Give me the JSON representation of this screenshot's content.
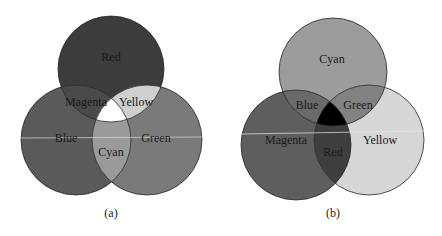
{
  "panels": [
    {
      "caption": "(a)",
      "model": "additive",
      "colors": {
        "primary": "#3c3c3c",
        "left": "#5a5a5a",
        "right": "#7a7a7a",
        "pair_top_left": "#4a4a4a",
        "pair_top_right": "#cfcfcf",
        "pair_bottom": "#9a9a9a",
        "center": "#ffffff"
      },
      "labels": {
        "top": "Red",
        "left": "Blue",
        "right": "Green",
        "top_left": "Magenta",
        "top_right": "Yellow",
        "bottom": "Cyan",
        "center": ""
      }
    },
    {
      "caption": "(b)",
      "model": "subtractive",
      "colors": {
        "primary": "#9c9c9c",
        "left": "#5e5e5e",
        "right": "#d6d6d6",
        "pair_top_left": "#6a6a6a",
        "pair_top_right": "#828282",
        "pair_bottom": "#3e3e3e",
        "center": "#000000"
      },
      "labels": {
        "top": "Cyan",
        "left": "Magenta",
        "right": "Yellow",
        "top_left": "Blue",
        "top_right": "Green",
        "bottom": "Red",
        "center": ""
      }
    }
  ]
}
